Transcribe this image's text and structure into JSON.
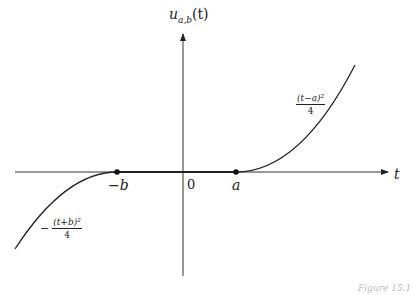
{
  "figure": {
    "y_axis_label": "u_{a,b}(t)",
    "y_axis_label_main": "u",
    "y_axis_label_sub": "a,b",
    "y_axis_label_arg": "(t)",
    "x_axis_label": "t",
    "tick_labels": {
      "neg_b": "−b",
      "zero": "0",
      "a": "a"
    },
    "right_formula": {
      "numerator": "(t−a)²",
      "denominator": "4"
    },
    "left_formula": {
      "sign": "−",
      "numerator": "(t+b)²",
      "denominator": "4"
    },
    "caption": "Figure 15.1",
    "colors": {
      "line": "#222222",
      "axis": "#333333",
      "background": "#ffffff"
    }
  }
}
